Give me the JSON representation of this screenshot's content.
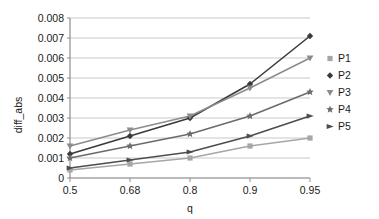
{
  "chart_data": {
    "type": "line",
    "title": "",
    "xlabel": "q",
    "ylabel": "diff_abs",
    "categories": [
      "0.5",
      "0.68",
      "0.8",
      "0.9",
      "0.95"
    ],
    "x_tick_labels": [
      "0.5",
      "0.68",
      "0.8",
      "0.9",
      "0.95"
    ],
    "y_tick_labels": [
      "0",
      "0.001",
      "0.002",
      "0.003",
      "0.004",
      "0.005",
      "0.006",
      "0.007",
      "0.008"
    ],
    "y_tick_values": [
      0,
      0.001,
      0.002,
      0.003,
      0.004,
      0.005,
      0.006,
      0.007,
      0.008
    ],
    "ylim": [
      0,
      0.008
    ],
    "grid": "horizontal",
    "legend_position": "right",
    "series": [
      {
        "name": "P1",
        "marker": "square",
        "color": "#a6a6a6",
        "values": [
          0.0004,
          0.0007,
          0.001,
          0.0016,
          0.002
        ]
      },
      {
        "name": "P2",
        "marker": "diamond",
        "color": "#3a3a3a",
        "values": [
          0.0012,
          0.0021,
          0.003,
          0.0047,
          0.0071
        ]
      },
      {
        "name": "P3",
        "marker": "triangle-down",
        "color": "#8c8c8c",
        "values": [
          0.0016,
          0.0024,
          0.0031,
          0.0045,
          0.006
        ]
      },
      {
        "name": "P4",
        "marker": "star",
        "color": "#6b6b6b",
        "values": [
          0.001,
          0.0016,
          0.0022,
          0.0031,
          0.0043
        ]
      },
      {
        "name": "P5",
        "marker": "right-arrow",
        "color": "#4d4d4d",
        "values": [
          0.0005,
          0.0009,
          0.0013,
          0.0021,
          0.0031
        ]
      }
    ]
  },
  "legend": {
    "items": [
      {
        "label": "P1",
        "marker": "square"
      },
      {
        "label": "P2",
        "marker": "diamond"
      },
      {
        "label": "P3",
        "marker": "triangle-down"
      },
      {
        "label": "P4",
        "marker": "star"
      },
      {
        "label": "P5",
        "marker": "right-arrow"
      }
    ]
  },
  "colors": {
    "grid": "#c9c9c9",
    "axis": "#8f8f8f",
    "text": "#1a1a1a",
    "background": "#ffffff"
  }
}
